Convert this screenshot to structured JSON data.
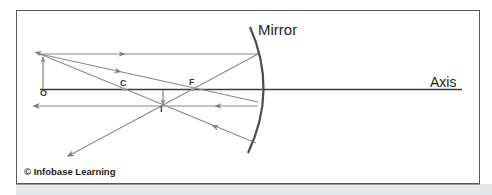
{
  "diagram": {
    "labels": {
      "mirror": "Mirror",
      "axis": "Axis",
      "object": "O",
      "center_of_curvature": "C",
      "focal_point": "F",
      "image": "I"
    },
    "copyright": "© Infobase Learning",
    "colors": {
      "rays": "#8a8a8a",
      "mirror": "#4d4d4d",
      "axis": "#3c3c3c",
      "frame": "#5a5a5a",
      "text": "#231f20",
      "band": "#e6e7e8"
    },
    "elements": {
      "object_arrow": "upward arrow at O above axis",
      "image_arrow": "inverted smaller arrow at I below axis, between C and F",
      "rays": [
        "parallel ray reflects through F",
        "ray through F reflects parallel to axis",
        "ray through C reflects back on itself"
      ]
    }
  }
}
